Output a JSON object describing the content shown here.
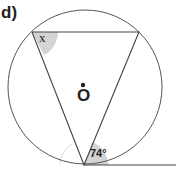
{
  "question_label": "d)",
  "center_label": "O",
  "angle_unknown": "x",
  "angle_known": "74°",
  "colors": {
    "line": "#444444",
    "shade": "#cfcfcf",
    "text": "#222222"
  }
}
